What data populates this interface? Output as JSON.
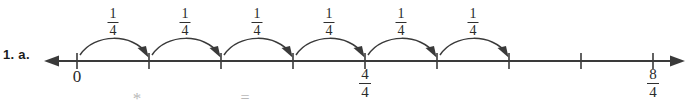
{
  "problem": {
    "label": "1. a."
  },
  "numberline": {
    "axis_color": "#3a3a3a",
    "tick_color": "#3a3a3a",
    "arrow_left": "arrow-left",
    "arrow_right": "arrow-right",
    "ticks": [
      {
        "x": 77,
        "label": "0",
        "label_type": "whole"
      },
      {
        "x": 149,
        "label": "",
        "label_type": "none"
      },
      {
        "x": 221,
        "label": "",
        "label_type": "none"
      },
      {
        "x": 293,
        "label": "",
        "label_type": "none"
      },
      {
        "x": 365,
        "label": "4/4",
        "label_type": "fraction",
        "numerator": "4",
        "denominator": "4"
      },
      {
        "x": 437,
        "label": "",
        "label_type": "none"
      },
      {
        "x": 509,
        "label": "",
        "label_type": "none"
      },
      {
        "x": 581,
        "label": "",
        "label_type": "none"
      },
      {
        "x": 653,
        "label": "8/4",
        "label_type": "fraction",
        "numerator": "8",
        "denominator": "4"
      }
    ]
  },
  "hops": [
    {
      "from_x": 77,
      "to_x": 149,
      "numerator": "1",
      "denominator": "4"
    },
    {
      "from_x": 149,
      "to_x": 221,
      "numerator": "1",
      "denominator": "4"
    },
    {
      "from_x": 221,
      "to_x": 293,
      "numerator": "1",
      "denominator": "4"
    },
    {
      "from_x": 293,
      "to_x": 365,
      "numerator": "1",
      "denominator": "4"
    },
    {
      "from_x": 365,
      "to_x": 437,
      "numerator": "1",
      "denominator": "4"
    },
    {
      "from_x": 437,
      "to_x": 509,
      "numerator": "1",
      "denominator": "4"
    }
  ],
  "cutoff_marks": [
    {
      "x": 137,
      "text": "*"
    },
    {
      "x": 245,
      "text": "="
    }
  ]
}
